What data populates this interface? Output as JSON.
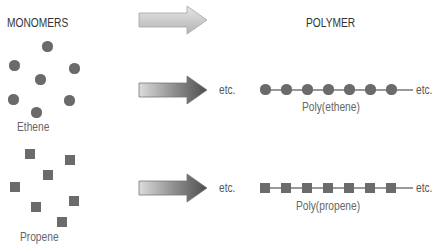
{
  "headings": {
    "monomers": "MONOMERS",
    "polymer": "POLYMER"
  },
  "monomers": [
    {
      "name": "Ethene",
      "shape": "circle",
      "positions": [
        [
          48,
          47
        ],
        [
          15,
          66
        ],
        [
          75,
          69
        ],
        [
          41,
          80
        ],
        [
          14,
          100
        ],
        [
          70,
          101
        ],
        [
          37,
          113
        ]
      ]
    },
    {
      "name": "Propene",
      "shape": "square",
      "positions": [
        [
          30,
          154
        ],
        [
          70,
          160
        ],
        [
          48,
          175
        ],
        [
          15,
          187
        ],
        [
          36,
          207
        ],
        [
          74,
          201
        ],
        [
          62,
          222
        ]
      ]
    }
  ],
  "polymers": [
    {
      "name": "Poly(ethene)",
      "shape": "circle",
      "units": 7,
      "etc_left": "etc.",
      "etc_right": "etc."
    },
    {
      "name": "Poly(propene)",
      "shape": "square",
      "units": 7,
      "etc_left": "etc.",
      "etc_right": "etc."
    }
  ],
  "arrows": [
    {
      "style": "light-gray"
    },
    {
      "style": "dark-gradient"
    },
    {
      "style": "dark-gradient"
    }
  ],
  "colors": {
    "unit_fill": "#6b6b6b",
    "chain_line": "#777777",
    "arrow_light": "#c8c8c8",
    "arrow_dark": "#5a5a5a"
  }
}
